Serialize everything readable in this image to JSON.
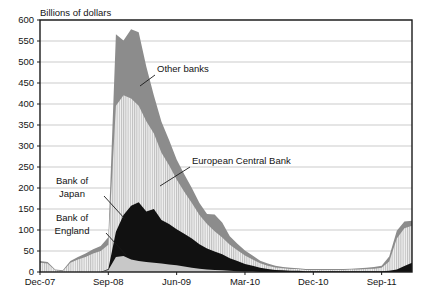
{
  "chart_data": {
    "type": "area",
    "stacked": true,
    "title": "",
    "ylabel": "Billions of dollars",
    "xlabel": "",
    "ylim": [
      0,
      600
    ],
    "ytick_step": 50,
    "grid": true,
    "legend_position": "inline-annotations",
    "yticks": [
      "0",
      "50",
      "100",
      "150",
      "200",
      "250",
      "300",
      "350",
      "400",
      "450",
      "500",
      "550",
      "600"
    ],
    "xticks": [
      "Dec-07",
      "Sep-08",
      "Jun-09",
      "Mar-10",
      "Dec-10",
      "Sep-11"
    ],
    "xtick_index": [
      0,
      9,
      18,
      27,
      36,
      45
    ],
    "n_points": 50,
    "series": [
      {
        "name": "Bank of England",
        "fill": "light-gray-solid",
        "color": "#c8c8c8",
        "values": [
          0,
          0,
          0,
          0,
          0,
          0,
          0,
          0,
          0,
          5,
          36,
          38,
          30,
          26,
          24,
          22,
          20,
          18,
          16,
          13,
          10,
          8,
          6,
          5,
          4,
          3,
          2,
          1,
          1,
          0,
          0,
          0,
          0,
          0,
          0,
          0,
          0,
          0,
          0,
          0,
          0,
          0,
          0,
          0,
          0,
          0,
          0,
          0,
          0,
          0
        ]
      },
      {
        "name": "Bank of Japan",
        "fill": "black-solid",
        "color": "#111111",
        "values": [
          0,
          0,
          0,
          0,
          0,
          0,
          0,
          0,
          0,
          2,
          60,
          98,
          128,
          140,
          120,
          128,
          104,
          96,
          86,
          78,
          70,
          58,
          50,
          44,
          38,
          30,
          24,
          18,
          14,
          10,
          7,
          5,
          4,
          3,
          3,
          2,
          2,
          2,
          2,
          2,
          2,
          2,
          2,
          2,
          2,
          2,
          3,
          6,
          14,
          22
        ]
      },
      {
        "name": "European Central Bank",
        "fill": "vertical-hatch",
        "color": "#e4e4e4",
        "values": [
          22,
          20,
          4,
          2,
          22,
          30,
          36,
          44,
          50,
          58,
          300,
          285,
          255,
          230,
          215,
          180,
          160,
          140,
          118,
          100,
          84,
          70,
          58,
          48,
          40,
          32,
          26,
          20,
          15,
          11,
          8,
          6,
          5,
          4,
          4,
          3,
          3,
          3,
          3,
          3,
          3,
          4,
          4,
          5,
          6,
          8,
          22,
          74,
          90,
          88
        ]
      },
      {
        "name": "Other banks",
        "fill": "mid-gray-solid",
        "color": "#8c8c8c",
        "values": [
          4,
          4,
          2,
          2,
          4,
          6,
          8,
          10,
          12,
          18,
          170,
          130,
          165,
          175,
          130,
          90,
          74,
          60,
          48,
          42,
          36,
          28,
          24,
          40,
          36,
          20,
          15,
          12,
          9,
          6,
          5,
          4,
          3,
          3,
          2,
          2,
          2,
          2,
          2,
          2,
          2,
          2,
          3,
          3,
          4,
          5,
          12,
          18,
          16,
          12
        ]
      }
    ],
    "annotations": [
      {
        "name": "other-banks",
        "label": "Other banks",
        "text_x": 157,
        "text_y": 72,
        "leader": [
          [
            155,
            75
          ],
          [
            140,
            86
          ]
        ]
      },
      {
        "name": "european-central-bank",
        "label": "European Central Bank",
        "text_x": 192,
        "text_y": 164,
        "leader": [
          [
            190,
            167
          ],
          [
            160,
            186
          ]
        ]
      },
      {
        "name": "bank-of-japan",
        "label_line1": "Bank of",
        "label_line2": "Japan",
        "text_x": 72,
        "text_y1": 184,
        "text_y2": 197,
        "leader": [
          [
            104,
            196
          ],
          [
            125,
            219
          ]
        ]
      },
      {
        "name": "bank-of-england",
        "label_line1": "Bank of",
        "label_line2": "England",
        "text_x": 72,
        "text_y1": 221,
        "text_y2": 234,
        "leader": [
          [
            106,
            233
          ],
          [
            126,
            255
          ]
        ]
      }
    ]
  }
}
